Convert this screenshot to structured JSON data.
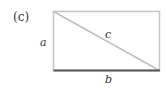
{
  "panel_label": "(c)",
  "labels": {
    "side_a": "a",
    "side_b": "b",
    "diagonal_c": "c"
  },
  "colors": {
    "outline": "#c8c8c8",
    "diagonal": "#c0c0c0",
    "base": "#555555",
    "text": "#333333"
  }
}
